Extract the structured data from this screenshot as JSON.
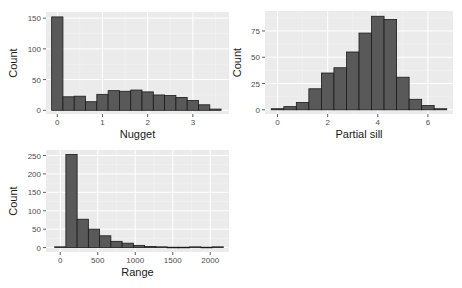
{
  "chart_data": [
    {
      "type": "bar",
      "subtype": "histogram",
      "title": "",
      "xlabel": "Nugget",
      "ylabel": "Count",
      "bin_width": 0.25,
      "bin_centers": [
        0,
        0.25,
        0.5,
        0.75,
        1.0,
        1.25,
        1.5,
        1.75,
        2.0,
        2.25,
        2.5,
        2.75,
        3.0,
        3.25,
        3.5
      ],
      "values": [
        152,
        22,
        23,
        14,
        26,
        32,
        31,
        33,
        30,
        25,
        24,
        21,
        16,
        9,
        2
      ],
      "xticks": [
        0,
        1,
        2,
        3
      ],
      "yticks": [
        0,
        50,
        100,
        150
      ],
      "xlim": [
        -0.25,
        3.8
      ],
      "ylim": [
        -6,
        160
      ],
      "grid": true
    },
    {
      "type": "bar",
      "subtype": "histogram",
      "title": "",
      "xlabel": "Partial sill",
      "ylabel": "Count",
      "bin_width": 0.5,
      "bin_centers": [
        0,
        0.5,
        1.0,
        1.5,
        2.0,
        2.5,
        3.0,
        3.5,
        4.0,
        4.5,
        5.0,
        5.5,
        6.0,
        6.5
      ],
      "values": [
        1,
        3,
        7,
        20,
        35,
        40,
        55,
        73,
        89,
        86,
        31,
        10,
        4,
        1
      ],
      "xticks": [
        0,
        2,
        4,
        6
      ],
      "yticks": [
        0,
        25,
        50,
        75
      ],
      "xlim": [
        -0.5,
        7.0
      ],
      "ylim": [
        -4,
        94
      ],
      "grid": true
    },
    {
      "type": "bar",
      "subtype": "histogram",
      "title": "",
      "xlabel": "Range",
      "ylabel": "Count",
      "bin_width": 150,
      "bin_centers": [
        0,
        150,
        300,
        450,
        600,
        750,
        900,
        1050,
        1200,
        1350,
        1500,
        1650,
        1800,
        1950,
        2100
      ],
      "values": [
        2,
        253,
        77,
        50,
        32,
        17,
        12,
        6,
        3,
        2,
        1,
        1,
        2,
        1,
        2
      ],
      "xticks": [
        0,
        500,
        1000,
        1500,
        2000
      ],
      "yticks": [
        0,
        50,
        100,
        150,
        200,
        250
      ],
      "xlim": [
        -190,
        2250
      ],
      "ylim": [
        -12,
        265
      ],
      "grid": true
    }
  ],
  "style": {
    "panel_bg": "#ebebeb",
    "grid_major": "#ffffff",
    "grid_minor": "#f5f5f5",
    "bar_fill": "#595959",
    "bar_stroke": "#1a1a1a"
  },
  "panels": [
    {
      "x": 46,
      "y": 12,
      "w": 183,
      "h": 102
    },
    {
      "x": 265,
      "y": 11,
      "w": 188,
      "h": 103
    },
    {
      "x": 46,
      "y": 150,
      "w": 183,
      "h": 102
    }
  ]
}
